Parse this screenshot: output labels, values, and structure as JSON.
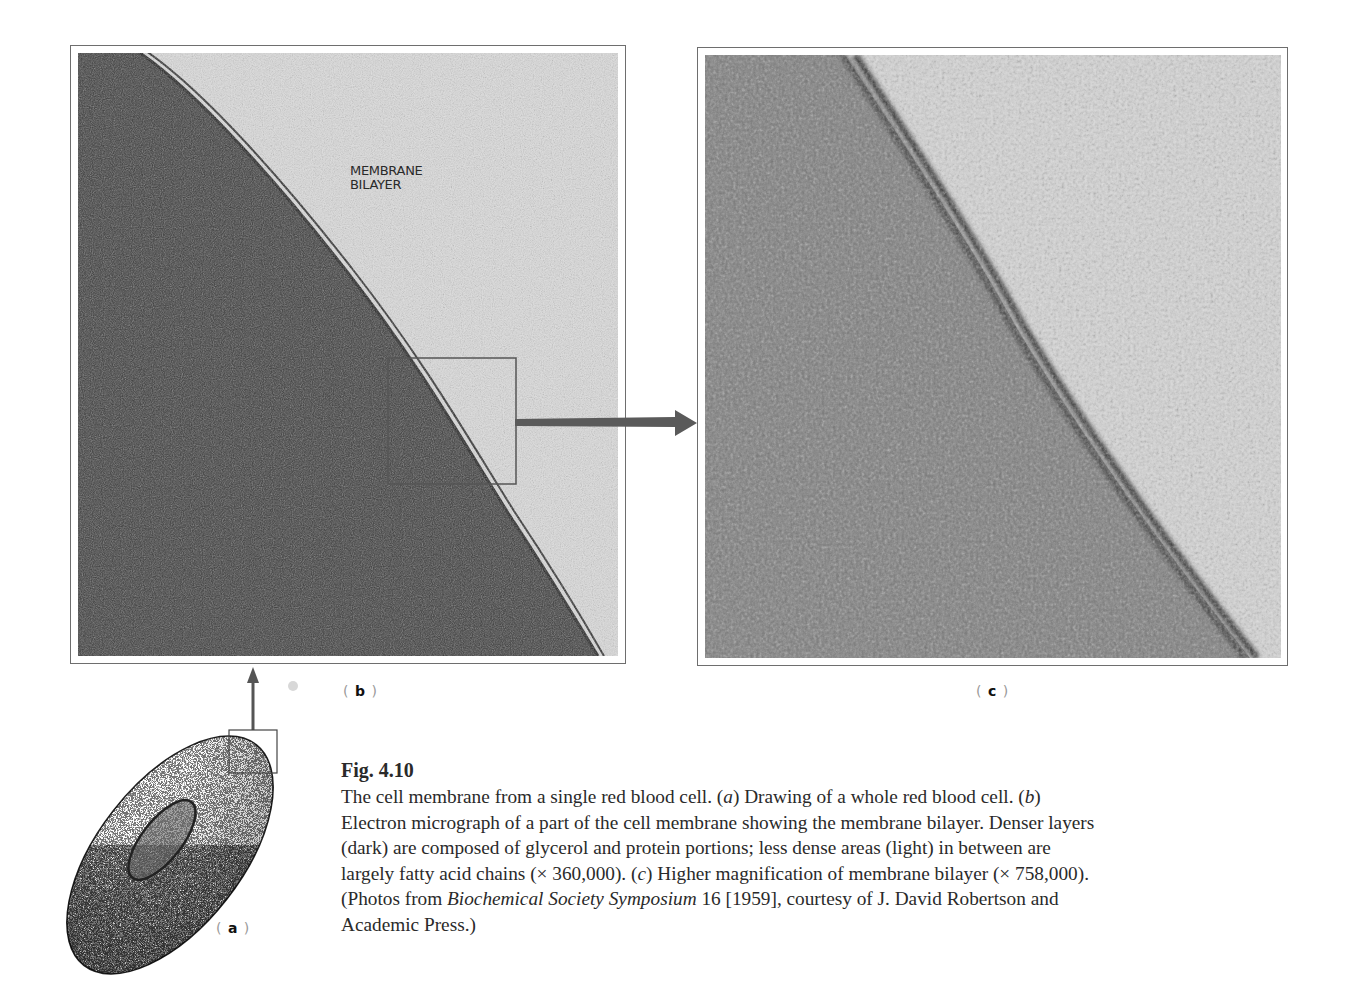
{
  "figure": {
    "number": "Fig. 4.10",
    "panels": {
      "a": {
        "label": "a",
        "description": "Drawing of a whole red blood cell (stippled biconcave disc with inset box at upper right edge)"
      },
      "b": {
        "label": "b",
        "overlay_text_line1": "MEMBRANE",
        "overlay_text_line2": "BILAYER"
      },
      "c": {
        "label": "c"
      }
    },
    "caption": {
      "s1": "The cell membrane from a single red blood cell. (",
      "a_letter": "a",
      "s2": ") Drawing of a whole red blood cell. (",
      "b_letter": "b",
      "s3": ") Electron micrograph of a part of the cell membrane showing the membrane bilayer. Denser layers (dark) are composed of glycerol and protein portions; less dense areas (light) in between are largely fatty acid chains (× 360,000). (",
      "c_letter": "c",
      "s4": ") Higher magnification of membrane bilayer (× 758,000). (Photos from ",
      "source_title": "Biochemical Society Symposium",
      "s5": " 16 [1959], courtesy of J. David Robertson and Academic Press.)"
    },
    "magnifications": {
      "b": "× 360,000",
      "c": "× 758,000"
    },
    "colors": {
      "frame": "#6e6e6e",
      "dark_cell": "#3a3a3a",
      "light_bg": "#d9d9d9",
      "arrow": "#5a5a5a"
    }
  }
}
